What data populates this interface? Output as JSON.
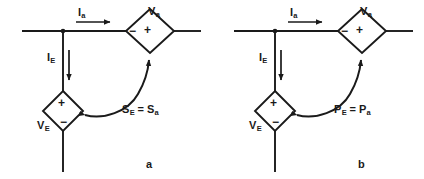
{
  "figure": {
    "stroke_color": "#1a1a1a",
    "background_color": "#ffffff"
  },
  "panels": [
    {
      "id": "a",
      "letter": "a",
      "current_horizontal": "I",
      "current_horizontal_sub": "a",
      "source_horizontal": "V",
      "source_horizontal_sub": "a",
      "source_horizontal_left_sign": "−",
      "source_horizontal_right_sign": "+",
      "current_vertical": "I",
      "current_vertical_sub": "E",
      "source_vertical": "V",
      "source_vertical_sub": "E",
      "source_vertical_top_sign": "+",
      "source_vertical_bottom_sign": "−",
      "relation_left": "S",
      "relation_left_sub": "E",
      "relation_operator": "=",
      "relation_right": "S",
      "relation_right_sub": "a"
    },
    {
      "id": "b",
      "letter": "b",
      "current_horizontal": "I",
      "current_horizontal_sub": "a",
      "source_horizontal": "V",
      "source_horizontal_sub": "a",
      "source_horizontal_left_sign": "−",
      "source_horizontal_right_sign": "+",
      "current_vertical": "I",
      "current_vertical_sub": "E",
      "source_vertical": "V",
      "source_vertical_sub": "E",
      "source_vertical_top_sign": "+",
      "source_vertical_bottom_sign": "−",
      "relation_left": "P",
      "relation_left_sub": "E",
      "relation_operator": "=",
      "relation_right": "P",
      "relation_right_sub": "a"
    }
  ]
}
